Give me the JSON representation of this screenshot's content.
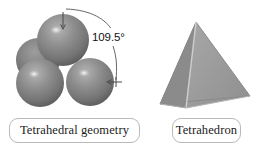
{
  "figure": {
    "background_color": "#ffffff",
    "width": 264,
    "height": 155
  },
  "panels": [
    {
      "id": "spheres",
      "caption": "Tetrahedral geometry",
      "annotation": {
        "value": "109.5°",
        "meaning": "tetrahedral-bond-angle"
      },
      "spheres": [
        {
          "name": "sphere-top",
          "cx": 63,
          "cy": 40,
          "r": 26,
          "fill": "#8a8a8a",
          "highlight": true
        },
        {
          "name": "sphere-back-left",
          "cx": 38,
          "cy": 60,
          "r": 22,
          "fill": "#7f7f7f",
          "highlight": false
        },
        {
          "name": "sphere-front-left",
          "cx": 40,
          "cy": 83,
          "r": 24,
          "fill": "#8a8a8a",
          "highlight": true
        },
        {
          "name": "sphere-front-right",
          "cx": 90,
          "cy": 82,
          "r": 24,
          "fill": "#8a8a8a",
          "highlight": true
        }
      ]
    },
    {
      "id": "tetrahedron",
      "caption": "Tetrahedron",
      "vertices": {
        "apex": [
          196,
          22
        ],
        "base_left": [
          160,
          104
        ],
        "base_right": [
          250,
          96
        ],
        "base_front": [
          186,
          108
        ]
      },
      "face_colors": {
        "left": "#8f8f8f",
        "right": "#9a9a9a",
        "edge": "#cfcfcf"
      }
    }
  ],
  "colors": {
    "sphere_gray": "#8a8a8a",
    "sphere_shadow": "#5e5e5e",
    "sphere_highlight": "#d8d8d8",
    "tetra_left_face": "#8f8f8f",
    "tetra_right_face": "#9a9a9a",
    "tetra_edge_line": "#cfcfcf",
    "caption_border": "#b9b9b9",
    "caption_text": "#1a1a1a",
    "annotation_line": "#555555"
  }
}
